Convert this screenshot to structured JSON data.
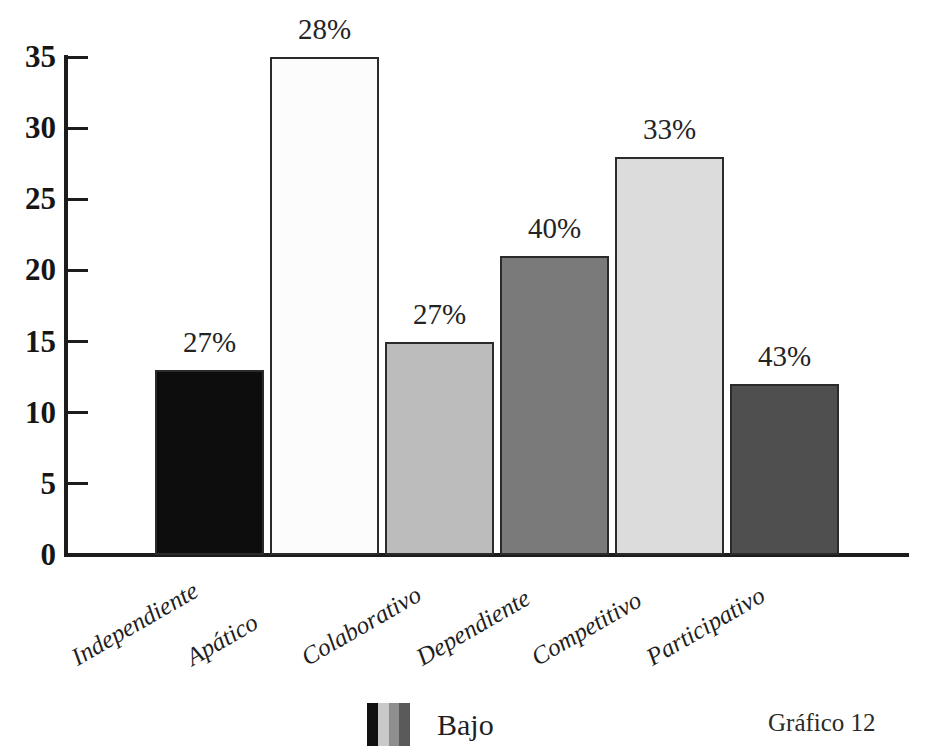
{
  "chart_data": {
    "type": "bar",
    "title": "",
    "subtitle": "",
    "xlabel": "",
    "ylabel": "",
    "categories": [
      "Independiente",
      "Apático",
      "Colaborativo",
      "Dependiente",
      "Competitivo",
      "Participativo"
    ],
    "values": [
      13,
      35,
      15,
      21,
      28,
      12
    ],
    "data_labels": [
      "27%",
      "28%",
      "27%",
      "40%",
      "33%",
      "43%"
    ],
    "bar_colors": [
      "#0d0d0d",
      "#fcfcfc",
      "#bcbcbc",
      "#7a7a7a",
      "#dcdcdc",
      "#4f4f4f"
    ],
    "bar_border_color": "#2b2b2b",
    "ylim": [
      0,
      35
    ],
    "ytick_labels": [
      "0",
      "5",
      "10",
      "15",
      "20",
      "25",
      "30",
      "35"
    ],
    "ytick_values": [
      0,
      5,
      10,
      15,
      20,
      25,
      30,
      35
    ],
    "grid": false,
    "legend_position": "bottom-center",
    "legend": [
      {
        "label": "Bajo",
        "swatch_stripes": [
          "#111111",
          "#c9c9c9",
          "#8e8e8e",
          "#5a5a5a"
        ]
      }
    ],
    "caption": "Gráfico 12"
  }
}
